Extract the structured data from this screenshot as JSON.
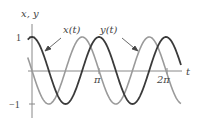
{
  "chart_data": {
    "type": "line",
    "title": "",
    "xlabel": "t",
    "ylabel": "x, y",
    "xlim": [
      -0.2,
      7.0
    ],
    "ylim": [
      -1,
      1
    ],
    "grid": false,
    "legend": "inline annotations with arrows",
    "x_ticks": [
      {
        "value": 3.14159,
        "label": "π"
      },
      {
        "value": 6.28319,
        "label": "2π"
      }
    ],
    "y_ticks": [
      {
        "value": 1,
        "label": "1"
      },
      {
        "value": -1,
        "label": "−1"
      }
    ],
    "series": [
      {
        "name": "x(t)",
        "formula": "cos(2t)",
        "color": "#3a3a3a",
        "x": [
          0,
          0.785,
          1.571,
          2.356,
          3.142,
          3.927,
          4.712,
          5.498,
          6.283
        ],
        "values": [
          1,
          0,
          -1,
          0,
          1,
          0,
          -1,
          0,
          1
        ]
      },
      {
        "name": "y(t)",
        "formula": "-sin(2t)",
        "color": "#9a9a9a",
        "x": [
          0,
          0.785,
          1.571,
          2.356,
          3.142,
          3.927,
          4.712,
          5.498,
          6.283
        ],
        "values": [
          0,
          -1,
          0,
          1,
          0,
          -1,
          0,
          1,
          0
        ]
      }
    ],
    "annotations": [
      "x(t)",
      "y(t)"
    ]
  },
  "labels": {
    "axis_y": "x, y",
    "axis_x": "t",
    "tick_pi": "π",
    "tick_2pi": "2π",
    "tick_one": "1",
    "tick_neg_one": "−1",
    "series_x": "x(t)",
    "series_y": "y(t)"
  }
}
